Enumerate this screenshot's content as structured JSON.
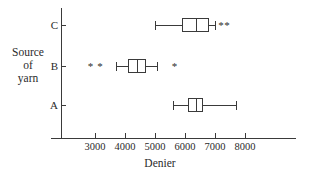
{
  "chart_data": {
    "type": "box",
    "title": "",
    "xlabel": "Denier",
    "ylabel": "Source of yarn",
    "ylabel_lines": [
      "Source",
      "of",
      "yarn"
    ],
    "orientation": "horizontal",
    "grid": false,
    "legend": "none",
    "xlim": [
      2200,
      8400
    ],
    "xticks": [
      3000,
      4000,
      5000,
      6000,
      7000,
      8000
    ],
    "xtick_labels": [
      "3000",
      "4000",
      "5000",
      "6000",
      "7000",
      "8000"
    ],
    "categories": [
      "A",
      "B",
      "C"
    ],
    "category_order_top_to_bottom": [
      "C",
      "B",
      "A"
    ],
    "boxes": [
      {
        "category": "C",
        "whisker_low": 5000,
        "q1": 5900,
        "median": 6350,
        "q3": 6800,
        "whisker_high": 7000,
        "outliers": [
          7200,
          7400
        ],
        "outlier_marker": "*"
      },
      {
        "category": "B",
        "whisker_low": 3700,
        "q1": 4100,
        "median": 4400,
        "q3": 4700,
        "whisker_high": 5050,
        "outliers": [
          2850,
          3170,
          5650
        ],
        "outlier_marker": "*"
      },
      {
        "category": "A",
        "whisker_low": 5600,
        "q1": 6100,
        "median": 6350,
        "q3": 6600,
        "whisker_high": 7700,
        "outliers": [],
        "outlier_marker": "*"
      }
    ],
    "colors": {
      "ink": "#3a3a3a",
      "text": "#2b2b2b",
      "background": "#ffffff"
    }
  }
}
